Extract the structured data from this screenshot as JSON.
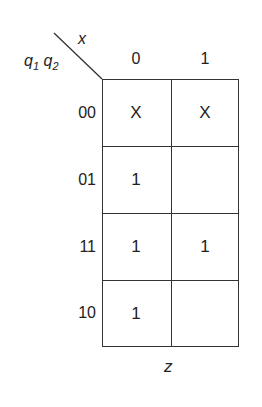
{
  "kmap": {
    "row_var_label": {
      "q1": "q",
      "q1_sub": "1",
      "q2": "q",
      "q2_sub": "2"
    },
    "col_var_label": "x",
    "output_label": "z",
    "col_headers": [
      "0",
      "1"
    ],
    "row_headers": [
      "00",
      "01",
      "11",
      "10"
    ],
    "cells": [
      [
        "X",
        "X"
      ],
      [
        "1",
        ""
      ],
      [
        "1",
        "1"
      ],
      [
        "1",
        ""
      ]
    ]
  }
}
